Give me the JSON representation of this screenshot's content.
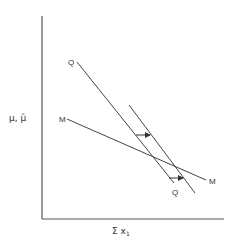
{
  "diagram": {
    "axes": {
      "y_label": "μ, μ̂",
      "x_label": "Σ x",
      "x_label_subscript": "1"
    },
    "curves": [
      {
        "id": "QQ",
        "label_start": "Q",
        "label_end": "Q",
        "description": "steep downward-sloping line"
      },
      {
        "id": "Q_shifted",
        "label_start": "",
        "label_end": "",
        "description": "QQ shifted right (unlabeled parallel line)"
      },
      {
        "id": "MM",
        "label_start": "M",
        "label_end": "M",
        "description": "flatter downward-sloping line"
      }
    ],
    "arrows": [
      {
        "direction": "right",
        "meaning": "shift of Q curve to the right (upper arrow)"
      },
      {
        "direction": "right",
        "meaning": "shift of Q curve to the right (lower arrow)"
      }
    ],
    "colors": {
      "line": "#444444",
      "text": "#333333",
      "background": "#ffffff"
    }
  }
}
